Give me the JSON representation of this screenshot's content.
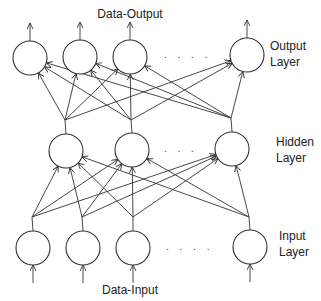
{
  "title_top": "Data-Output",
  "title_bottom": "Data-Input",
  "layers": {
    "output": {
      "label_line1": "Output",
      "label_line2": "Layer",
      "ellipsis": ". . . ."
    },
    "hidden": {
      "label_line1": "Hidden",
      "label_line2": "Layer",
      "ellipsis": ". . ."
    },
    "input": {
      "label_line1": "Input",
      "label_line2": "Layer",
      "ellipsis": ". . . ."
    }
  },
  "geometry": {
    "radius": 17,
    "output_nodes": [
      [
        30,
        58
      ],
      [
        80,
        57
      ],
      [
        130,
        57
      ],
      [
        247,
        55
      ]
    ],
    "hidden_nodes": [
      [
        66,
        151
      ],
      [
        132,
        150
      ],
      [
        232,
        149
      ]
    ],
    "input_nodes": [
      [
        33,
        248
      ],
      [
        83,
        248
      ],
      [
        133,
        248
      ],
      [
        250,
        247
      ]
    ],
    "hidden_junctions": [
      [
        65,
        120
      ],
      [
        131,
        120
      ],
      [
        231,
        118
      ]
    ],
    "input_junctions": [
      [
        32,
        217
      ],
      [
        82,
        217
      ],
      [
        133,
        217
      ],
      [
        249,
        217
      ]
    ]
  },
  "colors": {
    "stroke": "#333333",
    "background": "#ffffff"
  }
}
